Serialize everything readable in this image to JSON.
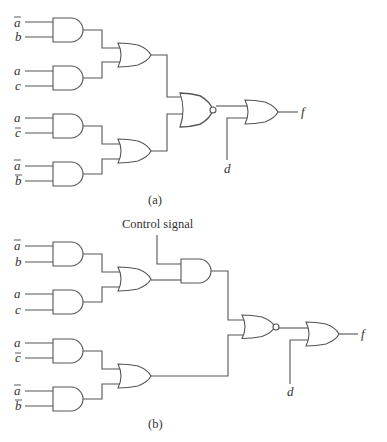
{
  "diagram": {
    "type": "logic-circuit",
    "panels": [
      {
        "caption": "(a)",
        "inputs": [
          {
            "label": "a",
            "negated": true
          },
          {
            "label": "b",
            "negated": false
          },
          {
            "label": "a",
            "negated": false
          },
          {
            "label": "c",
            "negated": false
          },
          {
            "label": "a",
            "negated": false
          },
          {
            "label": "c",
            "negated": true
          },
          {
            "label": "a",
            "negated": true
          },
          {
            "label": "b",
            "negated": true
          }
        ],
        "gates": [
          "AND",
          "AND",
          "AND",
          "AND",
          "OR",
          "OR",
          "NOR",
          "OR"
        ],
        "extra_input": "d",
        "output": "f"
      },
      {
        "caption": "(b)",
        "control_label": "Control signal",
        "inputs": [
          {
            "label": "a",
            "negated": true
          },
          {
            "label": "b",
            "negated": false
          },
          {
            "label": "a",
            "negated": false
          },
          {
            "label": "c",
            "negated": false
          },
          {
            "label": "a",
            "negated": false
          },
          {
            "label": "c",
            "negated": true
          },
          {
            "label": "a",
            "negated": true
          },
          {
            "label": "b",
            "negated": true
          }
        ],
        "gates": [
          "AND",
          "AND",
          "AND",
          "AND",
          "OR",
          "OR",
          "AND",
          "NOR",
          "OR"
        ],
        "extra_input": "d",
        "output": "f"
      }
    ]
  },
  "labels": {
    "a_top": {
      "in1": "a",
      "in2": "b",
      "in3": "a",
      "in4": "c",
      "in5": "a",
      "in6": "c",
      "in7": "a",
      "in8": "b",
      "d": "d",
      "f": "f",
      "caption": "(a)"
    },
    "b_bot": {
      "in1": "a",
      "in2": "b",
      "in3": "a",
      "in4": "c",
      "in5": "a",
      "in6": "c",
      "in7": "a",
      "in8": "b",
      "d": "d",
      "f": "f",
      "caption": "(b)",
      "control": "Control signal"
    }
  }
}
